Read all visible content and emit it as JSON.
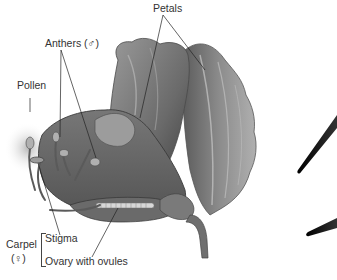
{
  "diagram": {
    "labels": {
      "petals": "Petals",
      "anthers": "Anthers (♂)",
      "pollen": "Pollen",
      "carpel": "Carpel",
      "carpel_symbol": "(♀)",
      "stigma": "Stigma",
      "ovary": "Ovary with ovules"
    },
    "colors": {
      "background": "#ffffff",
      "label_text": "#333333",
      "leader_line": "#222222",
      "petal_dark": "#5a5a5a",
      "petal_mid": "#8a8a8a",
      "petal_light": "#b5b5b5",
      "spike": "#111111"
    }
  }
}
